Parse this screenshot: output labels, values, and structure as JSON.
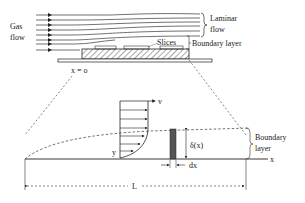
{
  "diagram": {
    "type": "boundary-layer-schematic",
    "top": {
      "gas_flow_label_line1": "Gas",
      "gas_flow_label_line2": "flow",
      "laminar_label_line1": "Laminar",
      "laminar_label_line2": "flow",
      "slices_label": "Slices",
      "boundary_layer_label": "Boundary layer",
      "origin_label": "x = o"
    },
    "bottom": {
      "velocity_axis_label": "v",
      "y_axis_label": "y",
      "x_axis_label": "x",
      "thickness_label": "δ(x)",
      "dx_label": "dx",
      "length_label": "L",
      "boundary_layer_line1": "Boundary",
      "boundary_layer_line2": "layer"
    },
    "colors": {
      "line": "#222222",
      "slab": "#555555",
      "background": "#ffffff"
    }
  }
}
